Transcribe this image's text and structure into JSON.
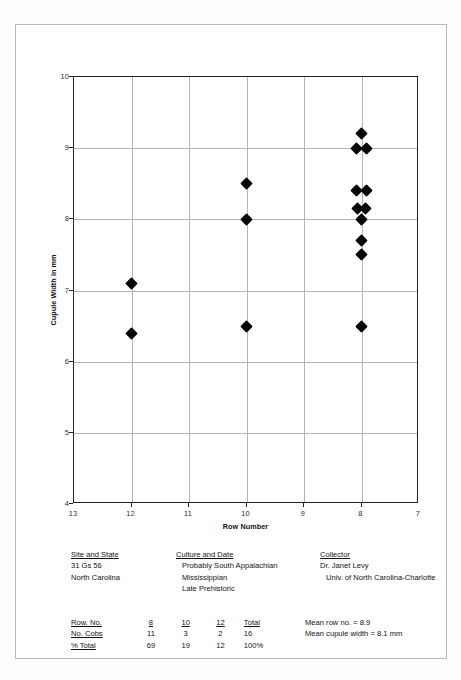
{
  "chart_data": {
    "type": "scatter",
    "title": "",
    "xlabel": "Row Number",
    "ylabel": "Cupule Width in mm",
    "xlim": [
      13,
      7
    ],
    "ylim": [
      4,
      10
    ],
    "x_ticks": [
      13,
      12,
      11,
      10,
      9,
      8,
      7
    ],
    "y_ticks": [
      4,
      5,
      6,
      7,
      8,
      9,
      10
    ],
    "x_axis_reversed": true,
    "grid": true,
    "legend": "none",
    "marker": "filled-diamond",
    "marker_color": "#050505",
    "points": [
      {
        "x": 12,
        "y": 7.1
      },
      {
        "x": 12,
        "y": 6.4
      },
      {
        "x": 10,
        "y": 8.5
      },
      {
        "x": 10,
        "y": 8.0
      },
      {
        "x": 10,
        "y": 6.5
      },
      {
        "x": 8,
        "y": 9.2
      },
      {
        "x": 8,
        "y": 9.0,
        "jitter": -0.09
      },
      {
        "x": 8,
        "y": 9.0,
        "jitter": 0.09
      },
      {
        "x": 8,
        "y": 8.4,
        "jitter": -0.09
      },
      {
        "x": 8,
        "y": 8.4,
        "jitter": 0.09
      },
      {
        "x": 8,
        "y": 8.15,
        "jitter": -0.07
      },
      {
        "x": 8,
        "y": 8.15,
        "jitter": 0.07
      },
      {
        "x": 8,
        "y": 8.0
      },
      {
        "x": 8,
        "y": 7.7
      },
      {
        "x": 8,
        "y": 7.5
      },
      {
        "x": 8,
        "y": 6.5
      }
    ]
  },
  "info": {
    "site": {
      "header": "Site and State",
      "line1": "31 Gs 56",
      "line2": "North Carolina"
    },
    "culture": {
      "header": "Culture and Date",
      "line1": "Probably South Appalachian",
      "line2": "Mississippian",
      "line3": "Late Prehistoric"
    },
    "collector": {
      "header": "Collector",
      "line1": "Dr. Janet Levy",
      "line2": "Univ. of North Carolina-Charlotte"
    }
  },
  "table": {
    "rows": [
      {
        "label": "Row. No.",
        "values": [
          "8",
          "10",
          "12"
        ],
        "total": "Total"
      },
      {
        "label": "No. Cobs",
        "values": [
          "11",
          "3",
          "2"
        ],
        "total": "16"
      },
      {
        "label": "% Total",
        "values": [
          "69",
          "19",
          "12"
        ],
        "total": "100%"
      }
    ]
  },
  "means": {
    "row_no": "Mean row no. = 8.9",
    "cupule_width": "Mean cupule width = 8.1 mm"
  }
}
